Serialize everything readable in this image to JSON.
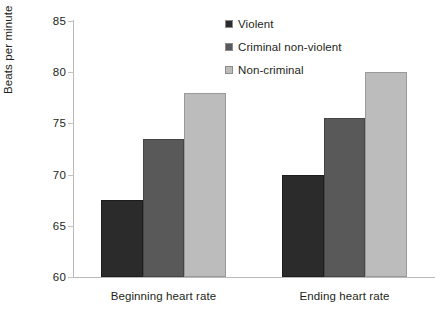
{
  "chart_data": {
    "type": "bar",
    "title": "",
    "subtitle": "",
    "xlabel": "",
    "ylabel": "Beats per minute",
    "categories": [
      "Beginning heart rate",
      "Ending heart rate"
    ],
    "series": [
      {
        "name": "Violent",
        "values": [
          67.5,
          70.0
        ],
        "color": "#2b2b2b"
      },
      {
        "name": "Criminal non-violent",
        "values": [
          73.5,
          75.5
        ],
        "color": "#595959"
      },
      {
        "name": "Non-criminal",
        "values": [
          78.0,
          80.0
        ],
        "color": "#bcbcbc"
      }
    ],
    "ylim": [
      60,
      85
    ],
    "yticks": [
      60,
      65,
      70,
      75,
      80,
      85
    ],
    "ytick_labels": [
      "60",
      "65",
      "70",
      "75",
      "80",
      "85"
    ],
    "grid": false,
    "legend_position": "top-center-right",
    "axis_color": "#b9b9b9",
    "text_color": "#231f20",
    "background": "#ffffff"
  }
}
